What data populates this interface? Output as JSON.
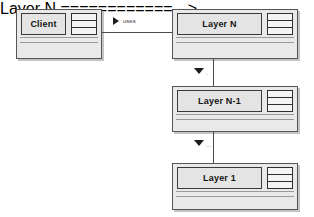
{
  "diagram": {
    "style": {
      "box_fill": "#e9e9e9",
      "name_fill": "#e4e4e4",
      "border": "#555555",
      "shadow": "#c4c4c4",
      "line": "#4a4a4a",
      "text": "#141414",
      "background": "#ffffff"
    }
  },
  "nodes": {
    "client": {
      "name": "Client",
      "icon": "three-row-table-icon",
      "compartment_lines": 2
    },
    "layer_n": {
      "name": "Layer N",
      "icon": "three-row-table-icon",
      "compartment_lines": 2
    },
    "layer_n_minus_1": {
      "name": "Layer N-1",
      "icon": "three-row-table-icon",
      "compartment_lines": 2
    },
    "layer_1": {
      "name": "Layer 1",
      "icon": "three-row-table-icon",
      "compartment_lines": 2
    }
  },
  "edges": {
    "client_uses_layer_n": {
      "label": "uses",
      "marker": "solid-right-triangle-icon",
      "from": "Client",
      "to": "Layer N"
    },
    "layer_n_to_n_minus_1": {
      "label": ".",
      "marker": "solid-down-triangle-icon",
      "from": "Layer N",
      "to": "Layer N-1"
    },
    "layer_n_minus_1_to_layer_1": {
      "label": "...",
      "marker": "solid-down-triangle-icon",
      "from": "Layer N-1",
      "to": "Layer 1"
    }
  }
}
